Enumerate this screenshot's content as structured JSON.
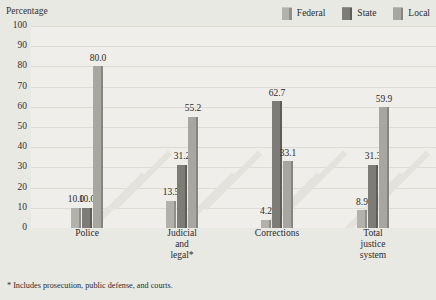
{
  "chart_data": {
    "type": "bar",
    "title": "",
    "ylabel": "Percentage",
    "xlabel": "",
    "ylim": [
      0,
      100
    ],
    "ytick_step": 10,
    "yticks": [
      "100",
      "90",
      "80",
      "70",
      "60",
      "50",
      "40",
      "30",
      "20",
      "10",
      "0"
    ],
    "grid": true,
    "legend_position": "top-right",
    "categories": [
      "Police",
      "Judicial and legal*",
      "Corrections",
      "Total justice system"
    ],
    "category_label_lines": [
      [
        "Police"
      ],
      [
        "Judicial",
        "and",
        "legal*"
      ],
      [
        "Corrections"
      ],
      [
        "Total",
        "justice",
        "system"
      ]
    ],
    "series": [
      {
        "name": "Federal",
        "color": "#b2b1ab",
        "values": [
          10.0,
          13.5,
          4.2,
          8.9
        ],
        "labels": [
          "10.0",
          "13.5",
          "4.2",
          "8.9"
        ]
      },
      {
        "name": "State",
        "color": "#7d7c76",
        "values": [
          10.0,
          31.2,
          62.7,
          31.3
        ],
        "labels": [
          "10.0",
          "31.2",
          "62.7",
          "31.3"
        ]
      },
      {
        "name": "Local",
        "color": "#a7a6a0",
        "values": [
          80.0,
          55.2,
          33.1,
          59.9
        ],
        "labels": [
          "80.0",
          "55.2",
          "33.1",
          "59.9"
        ]
      }
    ],
    "annotations": [
      "* Includes prosecution, public defense, and courts."
    ]
  },
  "legend": {
    "items": [
      {
        "label": "Federal"
      },
      {
        "label": "State"
      },
      {
        "label": "Local"
      }
    ]
  },
  "footnote": {
    "text": "* Includes prosecution, public defense, and courts."
  },
  "colors": {
    "background": "#e9e9e4",
    "plot_background": "#efeeea",
    "gridline": "#dedbd4",
    "text": "#2b2b2b",
    "federal": "#b2b1ab",
    "state": "#7d7c76",
    "local": "#a7a6a0"
  }
}
